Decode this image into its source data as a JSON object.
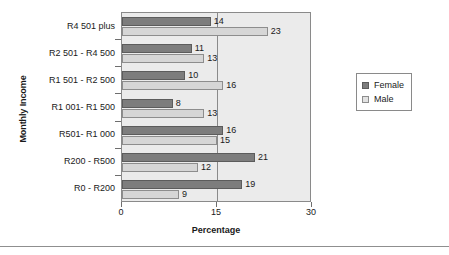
{
  "chart_data": {
    "type": "bar",
    "orientation": "horizontal",
    "title": "",
    "xlabel": "Percentage",
    "ylabel": "Monthly Income",
    "xlim": [
      0,
      30
    ],
    "xticks": [
      0,
      15,
      30
    ],
    "xtick_labels": [
      "0",
      "15",
      "30"
    ],
    "grid": "vertical gridline at 15",
    "legend_position": "right",
    "categories": [
      "R4 501 plus",
      "R2 501 - R4 500",
      "R1 501 - R2 500",
      "R1 001- R1 500",
      "R501- R1 000",
      "R200 - R500",
      "R0 - R200"
    ],
    "series": [
      {
        "name": "Female",
        "color": "#7d7d7d",
        "values": [
          14,
          11,
          10,
          8,
          16,
          21,
          19
        ]
      },
      {
        "name": "Male",
        "color": "#d6d6d6",
        "values": [
          23,
          13,
          16,
          13,
          15,
          12,
          9
        ]
      }
    ],
    "data_labels": {
      "Female": [
        "14",
        "11",
        "10",
        "8",
        "16",
        "21",
        "19"
      ],
      "Male": [
        "23",
        "13",
        "16",
        "13",
        "15",
        "12",
        "9"
      ]
    }
  },
  "legend": {
    "items": [
      {
        "label": "Female",
        "swatch": "female"
      },
      {
        "label": "Male",
        "swatch": "male"
      }
    ]
  },
  "axes": {
    "x_title": "Percentage",
    "y_title": "Monthly Income",
    "x_tick_0": "0",
    "x_tick_1": "15",
    "x_tick_2": "30"
  },
  "colors": {
    "female_bar": "#7d7d7d",
    "male_bar": "#d6d6d6",
    "plot_background": "#ebebeb",
    "frame": "#8a8a8a",
    "text": "#1a1a1a"
  }
}
